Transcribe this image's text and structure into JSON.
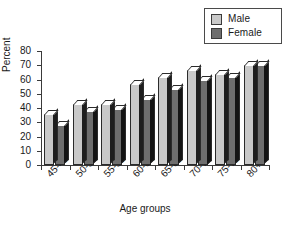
{
  "chart_data": {
    "type": "bar",
    "title": "",
    "xlabel": "Age groups",
    "ylabel": "Percent",
    "ylim": [
      0,
      80
    ],
    "yticks": [
      0,
      10,
      20,
      30,
      40,
      50,
      60,
      70,
      80
    ],
    "grid": false,
    "legend_position": "top-right",
    "categories": [
      "45-49",
      "50-54",
      "55-59",
      "60-64",
      "65-69",
      "70-74",
      "75-79",
      "80+"
    ],
    "series": [
      {
        "name": "Male",
        "color": "#c9c9c9",
        "values": [
          36,
          43,
          43,
          57,
          62,
          67,
          64,
          70
        ]
      },
      {
        "name": "Female",
        "color": "#6e6e6e",
        "values": [
          28,
          38,
          39,
          46,
          53,
          60,
          62,
          70
        ]
      }
    ]
  },
  "legend": {
    "items": [
      {
        "label": "Male",
        "swatch": "#c9c9c9"
      },
      {
        "label": "Female",
        "swatch": "#6e6e6e"
      }
    ]
  },
  "axes": {
    "y_title": "Percent",
    "x_title": "Age groups",
    "y_tick_labels": [
      "80",
      "70",
      "60",
      "50",
      "40",
      "30",
      "20",
      "10",
      "0"
    ],
    "x_tick_labels": [
      "45-49",
      "50-54",
      "55-59",
      "60-64",
      "65-69",
      "70-74",
      "75-79",
      "80+"
    ]
  },
  "caption": ""
}
